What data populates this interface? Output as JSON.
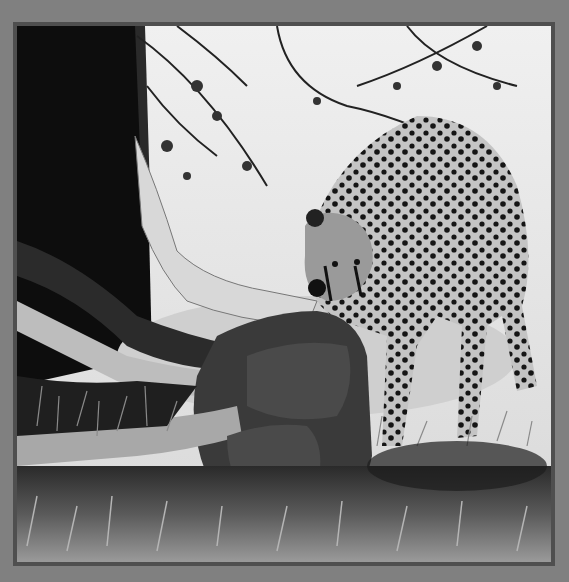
{
  "image": {
    "type": "photograph",
    "style": "black-and-white",
    "subject": "cheetah feeding on antelope prey beneath a tree",
    "colors": {
      "mat": "#808080",
      "frame_line": "#4f4f4f",
      "sky": "#e6e6e6",
      "tree_trunk": "#0d0d0d",
      "prey_body": "#3a3a3a",
      "cheetah_fur": "#bdbdbd",
      "spots": "#141414"
    }
  }
}
